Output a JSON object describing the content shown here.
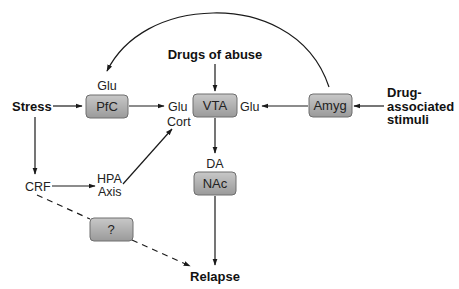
{
  "diagram": {
    "colors": {
      "box_fill_top": "#c8c8c8",
      "box_fill_bottom": "#9a9a9a",
      "box_stroke": "#6e6e6e",
      "line": "#1a1a1a",
      "text": "#222222"
    },
    "nodes": {
      "pfc": "PfC",
      "vta": "VTA",
      "amyg": "Amyg",
      "nac": "NAc",
      "unknown": "?"
    },
    "labels": {
      "stress": "Stress",
      "drugs_of_abuse": "Drugs of abuse",
      "drug_associated_line1": "Drug-",
      "drug_associated_line2": "associated",
      "drug_associated_line3": "stimuli",
      "glu_above_pfc": "Glu",
      "glu_left_vta": "Glu",
      "cort": "Cort",
      "glu_right_vta": "Glu",
      "da": "DA",
      "crf": "CRF",
      "hpa_line1": "HPA",
      "hpa_line2": "Axis",
      "relapse": "Relapse"
    },
    "edges": [
      {
        "from": "Stress",
        "to": "PfC",
        "style": "solid"
      },
      {
        "from": "PfC",
        "to": "Glu (VTA input)",
        "style": "solid"
      },
      {
        "from": "Drugs of abuse",
        "to": "VTA",
        "style": "solid"
      },
      {
        "from": "Amyg",
        "to": "Glu (VTA input)",
        "style": "solid"
      },
      {
        "from": "Drug-associated stimuli",
        "to": "Amyg",
        "style": "solid"
      },
      {
        "from": "Amyg",
        "to": "Glu (PfC input)",
        "style": "solid-curved"
      },
      {
        "from": "VTA",
        "to": "DA / NAc",
        "style": "solid"
      },
      {
        "from": "NAc",
        "to": "Relapse",
        "style": "solid"
      },
      {
        "from": "Stress",
        "to": "CRF",
        "style": "solid"
      },
      {
        "from": "CRF",
        "to": "HPA Axis",
        "style": "solid"
      },
      {
        "from": "HPA Axis",
        "to": "Cort",
        "style": "solid"
      },
      {
        "from": "CRF",
        "to": "?",
        "style": "dashed"
      },
      {
        "from": "?",
        "to": "Relapse",
        "style": "dashed"
      }
    ]
  }
}
